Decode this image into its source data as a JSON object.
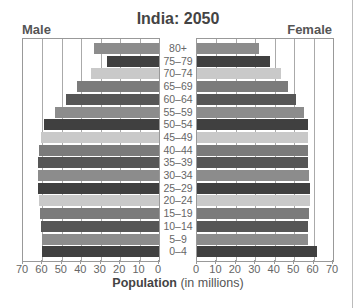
{
  "chart_data": {
    "type": "bar",
    "subtype": "population-pyramid",
    "title": "India: 2050",
    "xlabel": "Population (in millions)",
    "xlabel_bold": "Population",
    "xlabel_rest": " (in millions)",
    "left_label": "Male",
    "right_label": "Female",
    "xlim": [
      0,
      70
    ],
    "xticks": [
      0,
      10,
      20,
      30,
      40,
      50,
      60,
      70
    ],
    "grid": true,
    "categories": [
      "80+",
      "75–79",
      "70–74",
      "65–69",
      "60–64",
      "55–59",
      "50–54",
      "45–49",
      "40–44",
      "35–39",
      "30–34",
      "25–29",
      "20–24",
      "15–19",
      "10–14",
      "5–9",
      "0–4"
    ],
    "series": [
      {
        "name": "Male",
        "values": [
          33.5,
          27,
          35,
          42,
          48,
          53.5,
          59,
          61,
          62,
          62.5,
          62.5,
          62.5,
          62,
          61.5,
          61,
          60,
          60
        ]
      },
      {
        "name": "Female",
        "values": [
          32,
          37.5,
          43,
          47,
          51,
          55,
          57,
          57,
          57,
          57,
          57.5,
          58,
          58,
          57.5,
          57,
          57,
          62
        ]
      }
    ],
    "bar_colors": [
      "#8c8c8c",
      "#404040",
      "#c9c9c9",
      "#7b7b7b",
      "#565656",
      "#8c8c8c",
      "#404040",
      "#c9c9c9",
      "#7b7b7b",
      "#565656",
      "#8c8c8c",
      "#404040",
      "#c9c9c9",
      "#7b7b7b",
      "#565656",
      "#8c8c8c",
      "#404040"
    ]
  }
}
